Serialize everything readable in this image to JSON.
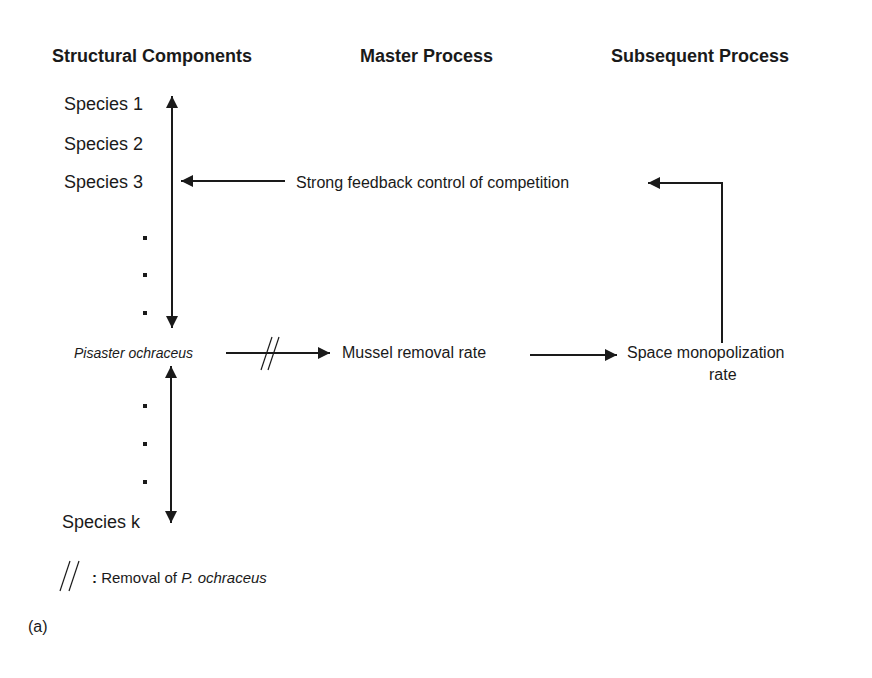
{
  "headers": {
    "structural": "Structural Components",
    "master": "Master Process",
    "subsequent": "Subsequent Process"
  },
  "species": {
    "s1": "Species 1",
    "s2": "Species 2",
    "s3": "Species 3",
    "pisaster": "Pisaster ochraceus",
    "sk": "Species k"
  },
  "processes": {
    "feedback": "Strong feedback control of competition",
    "mussel": "Mussel removal rate",
    "space_line1": "Space monopolization",
    "space_line2": "rate"
  },
  "legend": {
    "symbol": "//",
    "colon": ":",
    "text_plain": "Removal of ",
    "text_italic": "P. ochraceus"
  },
  "panel_label": "(a)",
  "colors": {
    "line": "#1a1a1a",
    "background": "#ffffff"
  }
}
